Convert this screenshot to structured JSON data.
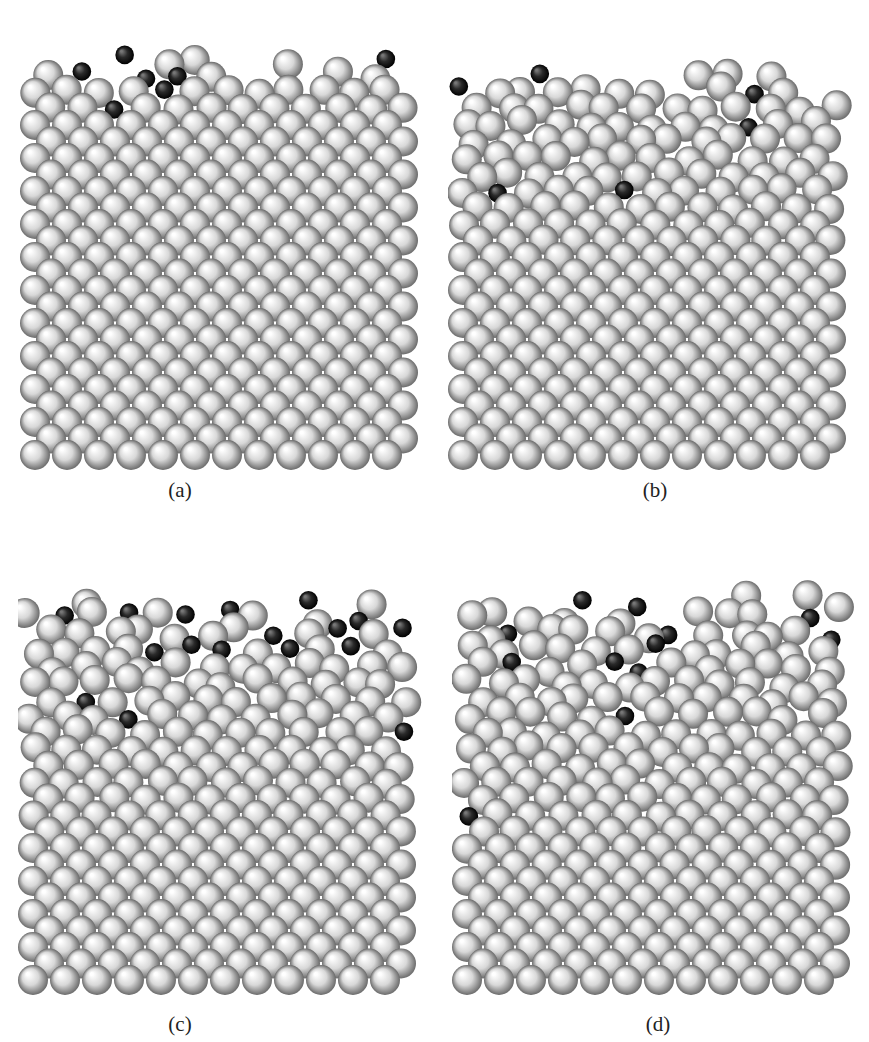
{
  "figure": {
    "panels": [
      {
        "id": "a",
        "label": "(a)",
        "x": 20,
        "y": 10,
        "w": 405,
        "h": 460,
        "label_x": 180,
        "label_y": 478,
        "disorder_depth": 0.22,
        "surface_roughness": 0.1,
        "dark_fraction_surface": 0.35,
        "dark_fraction_bulk": 0.01,
        "seed": 11
      },
      {
        "id": "b",
        "label": "(b)",
        "x": 448,
        "y": 10,
        "w": 410,
        "h": 460,
        "label_x": 655,
        "label_y": 478,
        "disorder_depth": 0.55,
        "surface_roughness": 0.12,
        "dark_fraction_surface": 0.4,
        "dark_fraction_bulk": 0.06,
        "seed": 23
      },
      {
        "id": "c",
        "label": "(c)",
        "x": 18,
        "y": 560,
        "w": 405,
        "h": 435,
        "label_x": 180,
        "label_y": 1012,
        "disorder_depth": 0.65,
        "surface_roughness": 0.1,
        "dark_fraction_surface": 0.45,
        "dark_fraction_bulk": 0.12,
        "seed": 37
      },
      {
        "id": "d",
        "label": "(d)",
        "x": 452,
        "y": 560,
        "w": 405,
        "h": 435,
        "label_x": 658,
        "label_y": 1012,
        "disorder_depth": 0.75,
        "surface_roughness": 0.1,
        "dark_fraction_surface": 0.4,
        "dark_fraction_bulk": 0.1,
        "seed": 51
      }
    ],
    "atom_style": {
      "radius": 15,
      "spacing_x": 32,
      "spacing_y": 16.5,
      "light_highlight": "#ffffff",
      "light_mid": "#d8d8d8",
      "light_shadow": "#6a6a6a",
      "dark_highlight": "#777777",
      "dark_mid": "#2a2a2a",
      "dark_shadow": "#000000",
      "dark_radius_scale": 0.62
    }
  }
}
